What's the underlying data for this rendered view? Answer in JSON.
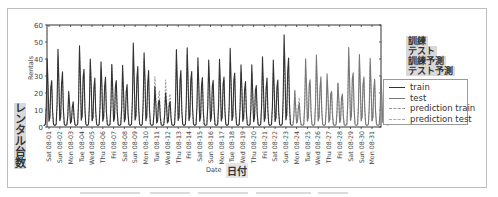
{
  "chart_data": {
    "type": "line",
    "title": "",
    "xlabel": "Date",
    "xlabel_jp": "日付",
    "ylabel": "Rentals",
    "ylabel_jp": "レンタル台数",
    "ylim": [
      0,
      60
    ],
    "yticks": [
      0,
      10,
      20,
      30,
      40,
      50,
      60
    ],
    "grid": false,
    "legend_position": "right, outside plot",
    "x_tick_labels": [
      "Sat 08-01",
      "Sun 08-02",
      "Mon 08-03",
      "Tue 08-04",
      "Wed 08-05",
      "Thu 08-06",
      "Fri 08-07",
      "Sat 08-08",
      "Sun 08-09",
      "Mon 08-10",
      "Tue 08-11",
      "Wed 08-12",
      "Thu 08-13",
      "Fri 08-14",
      "Sat 08-15",
      "Sun 08-16",
      "Mon 08-17",
      "Tue 08-18",
      "Wed 08-19",
      "Thu 08-20",
      "Fri 08-21",
      "Sat 08-22",
      "Sun 08-23",
      "Mon 08-24",
      "Tue 08-25",
      "Wed 08-26",
      "Thu 08-27",
      "Fri 08-28",
      "Sat 08-29",
      "Sun 08-30",
      "Mon 08-31"
    ],
    "train_test_split": "Sun 08-23 / Mon 08-24",
    "series": [
      {
        "name": "train",
        "style": "solid",
        "color": "#333333",
        "daily_peaks": [
          41,
          46,
          21,
          50,
          42,
          41,
          40,
          36,
          51,
          47,
          23,
          22,
          46,
          47,
          42,
          40,
          43,
          46,
          39,
          36,
          41,
          40,
          58
        ]
      },
      {
        "name": "test",
        "style": "solid",
        "color": "#777777",
        "daily_peaks": [
          20,
          42,
          42,
          32,
          28,
          48,
          44,
          40,
          30
        ]
      },
      {
        "name": "prediction train",
        "style": "dashed",
        "color": "#999999",
        "daily_peaks": [
          38,
          42,
          20,
          44,
          38,
          36,
          36,
          32,
          44,
          40,
          31,
          27,
          40,
          42,
          38,
          37,
          38,
          40,
          35,
          33,
          36,
          35,
          44
        ]
      },
      {
        "name": "prediction test",
        "style": "dashed",
        "color": "#aaaaaa",
        "daily_peaks": [
          24,
          36,
          38,
          30,
          27,
          42,
          40,
          36,
          28
        ]
      }
    ]
  },
  "legend": {
    "items": [
      {
        "label": "train",
        "style": "solid",
        "color": "#333333"
      },
      {
        "label": "test",
        "style": "solid",
        "color": "#777777"
      },
      {
        "label": "prediction train",
        "style": "dashed",
        "color": "#999999"
      },
      {
        "label": "prediction test",
        "style": "dashed",
        "color": "#aaaaaa"
      }
    ],
    "jp_annotations": [
      "訓練",
      "テスト",
      "訓練予測",
      "テスト予測"
    ]
  }
}
